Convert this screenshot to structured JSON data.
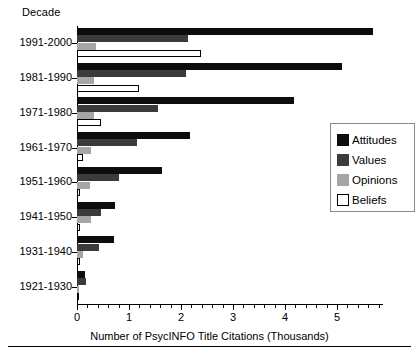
{
  "chart_data": {
    "type": "bar",
    "orientation": "horizontal",
    "title": "",
    "xlabel": "Number of PsycINFO Title Citations (Thousands)",
    "ylabel": "Decade",
    "categories": [
      "1991-2000",
      "1981-1990",
      "1971-1980",
      "1961-1970",
      "1951-1960",
      "1941-1950",
      "1931-1940",
      "1921-1930"
    ],
    "series": [
      {
        "name": "Attitudes",
        "color": "#0d0d0d",
        "values": [
          5.7,
          5.1,
          4.18,
          2.17,
          1.63,
          0.73,
          0.72,
          0.15
        ]
      },
      {
        "name": "Values",
        "color": "#3b3b3b",
        "values": [
          2.14,
          2.1,
          1.56,
          1.15,
          0.81,
          0.47,
          0.43,
          0.18
        ]
      },
      {
        "name": "Opinions",
        "color": "#a6a6a6",
        "values": [
          0.37,
          0.33,
          0.33,
          0.27,
          0.25,
          0.26,
          0.11,
          0.04
        ]
      },
      {
        "name": "Beliefs",
        "color": "#ffffff",
        "values": [
          2.38,
          1.2,
          0.46,
          0.12,
          0.06,
          0.05,
          0.05,
          0.03
        ]
      }
    ],
    "xlim": [
      0,
      5.85
    ],
    "xticks": [
      0,
      1,
      2,
      3,
      4,
      5
    ],
    "xtick_labels": [
      "0",
      "1",
      "2",
      "3",
      "4",
      "5"
    ],
    "minor_ticks_per_major": 5,
    "grid": false,
    "legend_position": "right-middle",
    "legend_entries": [
      "Attitudes",
      "Values",
      "Opinions",
      "Beliefs"
    ]
  },
  "axis": {
    "y_axis_title": "Decade",
    "x_axis_title": "Number of PsycINFO Title Citations (Thousands)"
  },
  "caption": {
    "text": ""
  },
  "colors": {
    "attitudes": "#0d0d0d",
    "values": "#3b3b3b",
    "opinions": "#a6a6a6",
    "beliefs": "#ffffff",
    "axis": "#000000",
    "legend_border": "#8a8a8a"
  }
}
